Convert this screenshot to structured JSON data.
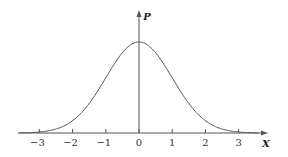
{
  "chart_data": {
    "type": "line",
    "title": "",
    "xlabel": "X",
    "ylabel": "P",
    "xlim": [
      -3.6,
      3.6
    ],
    "ylim": [
      0,
      0.4
    ],
    "grid": false,
    "legend": null,
    "x_ticks": [
      -3,
      -2,
      -1,
      0,
      1,
      2,
      3
    ],
    "x_tick_labels": [
      "−3",
      "−2",
      "−1",
      "0",
      "1",
      "2",
      "3"
    ],
    "series": [
      {
        "name": "standard normal density",
        "x": [
          -3.6,
          -3,
          -2.5,
          -2,
          -1.5,
          -1,
          -0.5,
          0,
          0.5,
          1,
          1.5,
          2,
          2.5,
          3,
          3.6
        ],
        "values": [
          0.0006,
          0.0044,
          0.0175,
          0.054,
          0.1295,
          0.242,
          0.3521,
          0.3989,
          0.3521,
          0.242,
          0.1295,
          0.054,
          0.0175,
          0.0044,
          0.0006
        ]
      }
    ]
  },
  "colors": {
    "curve": "#555555",
    "axis": "#555555",
    "background": "#ffffff"
  }
}
